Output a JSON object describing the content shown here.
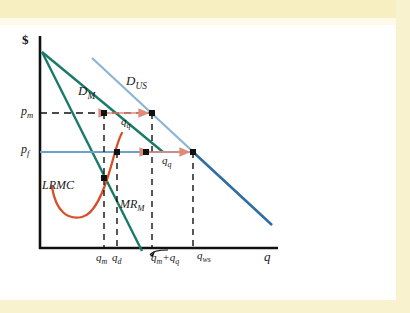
{
  "figure": {
    "type": "economics-diagram",
    "background_color": "#ffffff",
    "frame_color": "#f7eec2"
  },
  "axes": {
    "y_label": "$",
    "x_label": "q",
    "axis_color": "#111111",
    "origin": {
      "x": 40,
      "y": 248
    },
    "x_axis_end": {
      "x": 278,
      "y": 248
    },
    "y_axis_top": {
      "x": 40,
      "y": 36
    }
  },
  "price_ticks": [
    {
      "name": "p-sub-m",
      "label": "p",
      "sub": "m",
      "x": 22,
      "y": 106
    },
    {
      "name": "p-sub-f",
      "label": "p",
      "sub": "f",
      "x": 22,
      "y": 145
    }
  ],
  "quantity_ticks": [
    {
      "name": "q-sub-m",
      "label": "q",
      "sub": "m",
      "x": 97,
      "y": 255
    },
    {
      "name": "q-sub-d",
      "label": "q",
      "sub": "d",
      "x": 115,
      "y": 255
    },
    {
      "name": "q-m-plus-q-q",
      "label": "q",
      "sub": "m",
      "extra": "+q",
      "extra_sub": "q",
      "x": 157,
      "y": 255
    },
    {
      "name": "q-sub-ws",
      "label": "q",
      "sub": "ws",
      "x": 201,
      "y": 255
    }
  ],
  "curves": [
    {
      "name": "domestic-demand",
      "label": "D",
      "sub": "M",
      "color": "#1a7a68",
      "label_x": 79,
      "label_y": 88,
      "points": "42,52 160,148"
    },
    {
      "name": "world-demand",
      "label": "D",
      "sub": "US",
      "color": "#4b86b4",
      "label_x": 127,
      "label_y": 78,
      "points": "92,58 272,225"
    },
    {
      "name": "marginal-revenue-domestic",
      "label": "MR",
      "sub": "M",
      "color": "#1a7a68",
      "label_x": 122,
      "label_y": 203,
      "points": "42,52 141,250"
    },
    {
      "name": "long-run-marginal-cost",
      "label": "LRMC",
      "sub": "",
      "color": "#d4512a",
      "label_x": 44,
      "label_y": 183,
      "points": "curve"
    }
  ],
  "horizontal_lines": [
    {
      "name": "p-m-dashed-line",
      "style": "dashed",
      "color": "#111111",
      "from_x": 40,
      "to_x": 153,
      "y": 113
    },
    {
      "name": "p-f-price-line",
      "style": "solid",
      "color": "#5b93c4",
      "from_x": 40,
      "to_x": 195,
      "y": 152
    }
  ],
  "vertical_dashed_lines": [
    {
      "name": "q-m-dropline",
      "x": 104,
      "from_y": 113,
      "to_y": 248
    },
    {
      "name": "q-d-dropline",
      "x": 117,
      "from_y": 152,
      "to_y": 248
    },
    {
      "name": "q-m-plus-q-q-dropline",
      "x": 153,
      "from_y": 113,
      "to_y": 248
    },
    {
      "name": "q-ws-dropline",
      "x": 194,
      "from_y": 152,
      "to_y": 248
    }
  ],
  "annotation_arrows": [
    {
      "name": "q-q-arrow-upper",
      "label": "q",
      "sub": "q",
      "color": "#e08a78",
      "from_x": 106,
      "to_x": 151,
      "y": 113,
      "label_x": 120,
      "label_y": 120
    },
    {
      "name": "q-q-arrow-lower",
      "label": "q",
      "sub": "q",
      "color": "#e08a78",
      "from_x": 146,
      "to_x": 192,
      "y": 152,
      "label_x": 160,
      "label_y": 159
    }
  ],
  "markers": [
    {
      "name": "point-monopoly-domestic",
      "x": 104,
      "y": 113
    },
    {
      "name": "point-world-at-pm",
      "x": 152,
      "y": 113
    },
    {
      "name": "point-domestic-at-pf",
      "x": 117,
      "y": 152
    },
    {
      "name": "point-dm-at-pf",
      "x": 146,
      "y": 152
    },
    {
      "name": "point-world-at-pf",
      "x": 193,
      "y": 152
    },
    {
      "name": "point-mr-lrmc-intersection",
      "x": 104,
      "y": 178
    }
  ]
}
